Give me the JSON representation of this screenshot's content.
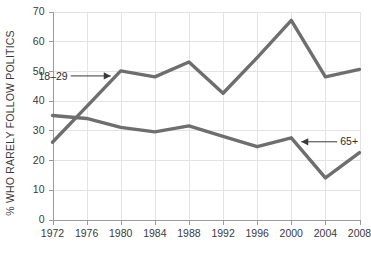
{
  "chart_data": {
    "type": "line",
    "title": "",
    "xlabel": "",
    "ylabel": "% WHO RARELY FOLLOW POLITICS",
    "x": [
      1972,
      1976,
      1980,
      1984,
      1988,
      1992,
      1996,
      2000,
      2004,
      2008
    ],
    "xtick_labels": [
      "1972",
      "1976",
      "1980",
      "1984",
      "1988",
      "1992",
      "1996",
      "2000",
      "2004",
      "2008"
    ],
    "ytick_labels": [
      "0",
      "10",
      "20",
      "30",
      "40",
      "50",
      "60",
      "70"
    ],
    "yticks": [
      0,
      10,
      20,
      30,
      40,
      50,
      60,
      70
    ],
    "ylim": [
      0,
      70
    ],
    "xlim": [
      1972,
      2008
    ],
    "grid": true,
    "legend_position": "inline-annotations",
    "series": [
      {
        "name": "18–29",
        "color": "#6e6e6e",
        "values": [
          26,
          38,
          50,
          48,
          53,
          42.5,
          54.5,
          67,
          48,
          50.5
        ],
        "annotation": {
          "label": "18–29",
          "anchor_year": 1980,
          "anchor_value": 50,
          "arrow_direction": "right"
        }
      },
      {
        "name": "65+",
        "color": "#6e6e6e",
        "values": [
          35,
          34,
          31,
          29.5,
          31.5,
          28,
          24.5,
          27.5,
          14,
          22.5
        ],
        "annotation": {
          "label": "65+",
          "anchor_year": 2000,
          "anchor_value": 27.5,
          "arrow_direction": "left"
        }
      }
    ],
    "colors": {
      "line": "#6e6e6e",
      "grid": "#e3e3e3",
      "axis": "#9a9a9a",
      "text": "#3a3a3a",
      "background": "#ffffff"
    }
  }
}
